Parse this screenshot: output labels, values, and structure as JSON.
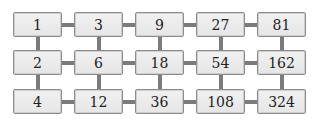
{
  "grid": {
    "rows": [
      [
        "1",
        "3",
        "9",
        "27",
        "81"
      ],
      [
        "2",
        "6",
        "18",
        "54",
        "162"
      ],
      [
        "4",
        "12",
        "36",
        "108",
        "324"
      ]
    ],
    "row_rule": "multiply by 3 to the right",
    "column_rule": "multiply by 2 downward"
  },
  "colors": {
    "cell_fill": "#ececec",
    "cell_border": "#8d8d8d",
    "connector": "#7b7b7b",
    "text": "#222222"
  }
}
